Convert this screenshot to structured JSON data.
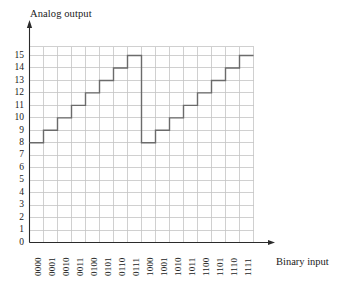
{
  "chart_data": {
    "type": "line",
    "title": "",
    "subtitle": "",
    "xlabel": "Binary input",
    "ylabel": "Analog output",
    "step_style": "post",
    "grid": true,
    "legend": "none",
    "xlim": [
      0,
      16
    ],
    "ylim": [
      0,
      15
    ],
    "ytick_labels": [
      "0",
      "1",
      "2",
      "3",
      "4",
      "5",
      "6",
      "7",
      "8",
      "9",
      "10",
      "11",
      "12",
      "13",
      "14",
      "15"
    ],
    "ytick_values": [
      0,
      1,
      2,
      3,
      4,
      5,
      6,
      7,
      8,
      9,
      10,
      11,
      12,
      13,
      14,
      15
    ],
    "categories": [
      "0000",
      "0001",
      "0010",
      "0011",
      "0100",
      "0101",
      "0110",
      "0111",
      "1000",
      "1001",
      "1010",
      "1011",
      "1100",
      "1101",
      "1110",
      "1111"
    ],
    "values": [
      8,
      9,
      10,
      11,
      12,
      13,
      14,
      15,
      8,
      9,
      10,
      11,
      12,
      13,
      14,
      15
    ],
    "series": [
      {
        "name": "Analog output",
        "color": "#6b6b6b",
        "values": [
          8,
          9,
          10,
          11,
          12,
          13,
          14,
          15,
          8,
          9,
          10,
          11,
          12,
          13,
          14,
          15
        ]
      }
    ],
    "annotations": [],
    "colors": {
      "line": "#6b6b6b",
      "grid": "#c4c4c4",
      "axis": "#2b2b2b",
      "text": "#1a1a1a",
      "background": "#ffffff"
    }
  },
  "axes": {
    "y_axis_label": "Analog output",
    "x_axis_label": "Binary input",
    "y_arrow": "up-arrow",
    "x_arrow": "right-arrow"
  }
}
